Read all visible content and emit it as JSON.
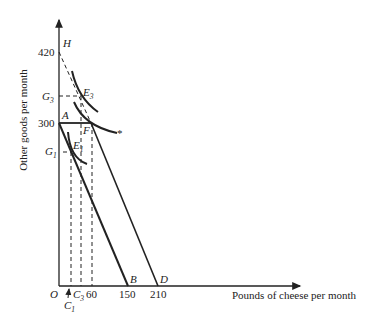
{
  "diagram": {
    "type": "indifference-curve-budget-constraint",
    "y_axis_label": "Other goods per month",
    "x_axis_label": "Pounds of cheese per month",
    "origin_label": "O",
    "y_ticks": [
      {
        "label": "420",
        "value": 420
      },
      {
        "label": "300",
        "value": 300
      }
    ],
    "y_markers": [
      {
        "label": "G",
        "sub": "3"
      },
      {
        "label": "G",
        "sub": "1"
      }
    ],
    "x_ticks": [
      {
        "label": "60",
        "value": 60
      },
      {
        "label": "150",
        "value": 150
      },
      {
        "label": "210",
        "value": 210
      }
    ],
    "x_markers": [
      {
        "label": "C",
        "sub": "3"
      },
      {
        "label": "C",
        "sub": "1"
      }
    ],
    "points": {
      "H": "H",
      "A": "A",
      "F": "F",
      "B": "B",
      "D": "D",
      "E3": {
        "label": "E",
        "sub": "3"
      },
      "E1": {
        "label": "E",
        "sub": "1"
      }
    },
    "star": "*",
    "colors": {
      "line": "#222222",
      "background": "#ffffff"
    }
  }
}
